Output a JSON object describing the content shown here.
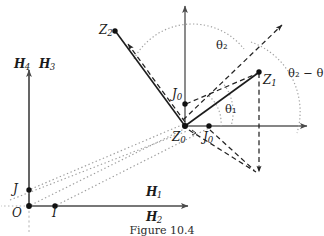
{
  "figure": {
    "caption": "Figure 10.4",
    "colors": {
      "ink": "#1a1a1a",
      "axis": "#4a4a4a",
      "dotted": "#9a9a9a",
      "dashed": "#2b2b2b",
      "background": "#ffffff"
    }
  },
  "points": [
    {
      "id": "Z2",
      "base": "Z",
      "sub": "2",
      "label": "Z₂",
      "x": 115,
      "y": 31,
      "label_x": 99,
      "label_y": 24
    },
    {
      "id": "Z1",
      "base": "Z",
      "sub": "1",
      "label": "Z₁",
      "x": 259,
      "y": 72,
      "label_x": 263,
      "label_y": 74
    },
    {
      "id": "Z0",
      "base": "Z",
      "sub": "0",
      "label": "Z₀",
      "x": 185,
      "y": 126,
      "label_x": 172,
      "label_y": 131
    },
    {
      "id": "J0_up",
      "base": "J",
      "sub": "0",
      "label": "J₀",
      "x": 185,
      "y": 104,
      "label_x": 172,
      "label_y": 88
    },
    {
      "id": "J0_rt",
      "base": "J",
      "sub": "0",
      "label": "J₀",
      "x": 209,
      "y": 126,
      "label_x": 203,
      "label_y": 131
    },
    {
      "id": "J",
      "base": "J",
      "sub": "",
      "label": "J",
      "x": 29,
      "y": 190,
      "label_x": 13,
      "label_y": 184
    },
    {
      "id": "O",
      "base": "O",
      "sub": "",
      "label": "O",
      "x": 29,
      "y": 206,
      "label_x": 12,
      "label_y": 207
    },
    {
      "id": "I",
      "base": "I",
      "sub": "",
      "label": "I",
      "x": 55,
      "y": 206,
      "label_x": 52,
      "label_y": 207
    }
  ],
  "axis_labels": [
    {
      "id": "H4",
      "label": "ℋ₄",
      "letter": "H",
      "sub": "4",
      "x": 14,
      "y": 59
    },
    {
      "id": "H3",
      "label": "ℋ₃",
      "letter": "H",
      "sub": "3",
      "x": 39,
      "y": 59
    },
    {
      "id": "H1",
      "label": "ℋ₁",
      "letter": "H",
      "sub": "1",
      "x": 146,
      "y": 188
    },
    {
      "id": "H2",
      "label": "ℋ₂",
      "letter": "H",
      "sub": "2",
      "x": 146,
      "y": 213
    }
  ],
  "angle_labels": [
    {
      "id": "theta2",
      "label": "θ₂",
      "x": 216,
      "y": 42
    },
    {
      "id": "theta1",
      "label": "θ₁",
      "x": 225,
      "y": 106
    },
    {
      "id": "theta2mtheta",
      "label": "θ₂ − θ",
      "x": 288,
      "y": 70
    }
  ],
  "vectors": [
    {
      "id": "Z0-to-Z2",
      "style": "solid",
      "from": "Z0",
      "to": "Z2"
    },
    {
      "id": "Z0-to-Z1",
      "style": "solid",
      "from": "Z0",
      "to": "Z1"
    },
    {
      "id": "Z0-to-Z2-dashed",
      "style": "dashed",
      "from": "Z0",
      "to": "Z2"
    },
    {
      "id": "Z0-to-Z1-dashed",
      "style": "dashed",
      "from": "Z0",
      "to": "Z1"
    }
  ]
}
